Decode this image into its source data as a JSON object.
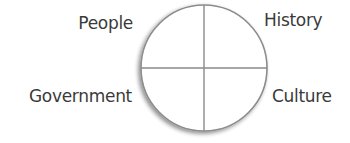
{
  "diagram": {
    "type": "quadrant-circle",
    "quadrants": {
      "top_left": "People",
      "top_right": "History",
      "bottom_left": "Government",
      "bottom_right": "Culture"
    },
    "colors": {
      "circle_stroke": "#888888",
      "divider": "#8a8a8a",
      "text": "#3a3a3a",
      "background": "#ffffff"
    }
  }
}
